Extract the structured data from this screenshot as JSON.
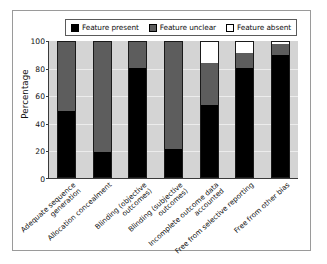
{
  "chart_data": {
    "type": "bar",
    "subtype": "stacked-bar-100-percent",
    "title": "",
    "xlabel": "",
    "ylabel": "Percentage",
    "ylim": [
      0,
      100
    ],
    "yticks": [
      0,
      20,
      40,
      60,
      80,
      100
    ],
    "grid": true,
    "legend_position": "top",
    "categories": [
      "Adequate sequence generation",
      "Allocation concealment",
      "Blinding (objective outcomes)",
      "Blinding (subjective outcomes)",
      "Incomplete outcome data accounted",
      "Free from selective reporting",
      "Free from other bias"
    ],
    "series": [
      {
        "name": "Feature present",
        "color": "#000000",
        "values": [
          49,
          19,
          80,
          21,
          53,
          80,
          90
        ]
      },
      {
        "name": "Feature unclear",
        "color": "#5d5d5d",
        "values": [
          51,
          81,
          20,
          79,
          31,
          11,
          8
        ]
      },
      {
        "name": "Feature absent",
        "color": "#ffffff",
        "values": [
          0,
          0,
          0,
          0,
          16,
          9,
          2
        ]
      }
    ]
  },
  "legend": {
    "items": [
      {
        "label": "Feature present",
        "swatch": "black-square-icon"
      },
      {
        "label": "Feature unclear",
        "swatch": "gray-square-icon"
      },
      {
        "label": "Feature absent",
        "swatch": "white-square-icon"
      }
    ]
  },
  "axes": {
    "y_title": "Percentage",
    "y_tick_labels": [
      "100",
      "80",
      "60",
      "40",
      "20",
      "0"
    ]
  },
  "colors": {
    "plot_background": "#d4d4d4",
    "figure_background": "#ffffff",
    "frame": "#9a9a9a",
    "axis": "#3a3a3a",
    "gridline": "#ececec",
    "present": "#000000",
    "unclear": "#5d5d5d",
    "absent": "#ffffff"
  }
}
